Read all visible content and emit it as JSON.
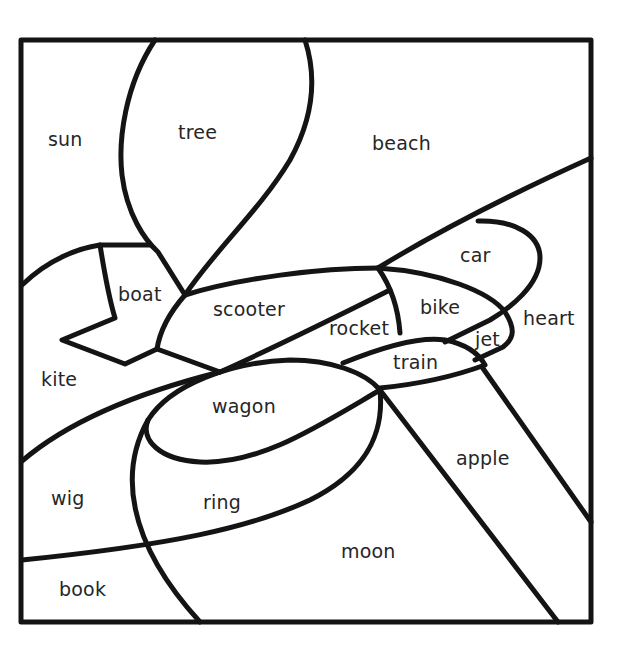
{
  "worksheet": {
    "regions": [
      {
        "id": "sun",
        "label": "sun",
        "x": 48,
        "y": 130
      },
      {
        "id": "tree",
        "label": "tree",
        "x": 178,
        "y": 123
      },
      {
        "id": "beach",
        "label": "beach",
        "x": 372,
        "y": 134
      },
      {
        "id": "car",
        "label": "car",
        "x": 460,
        "y": 246
      },
      {
        "id": "boat",
        "label": "boat",
        "x": 118,
        "y": 285
      },
      {
        "id": "scooter",
        "label": "scooter",
        "x": 213,
        "y": 300
      },
      {
        "id": "bike",
        "label": "bike",
        "x": 420,
        "y": 298
      },
      {
        "id": "heart",
        "label": "heart",
        "x": 523,
        "y": 309
      },
      {
        "id": "rocket",
        "label": "rocket",
        "x": 329,
        "y": 319
      },
      {
        "id": "jet",
        "label": "jet",
        "x": 475,
        "y": 330
      },
      {
        "id": "train",
        "label": "train",
        "x": 393,
        "y": 353
      },
      {
        "id": "kite",
        "label": "kite",
        "x": 41,
        "y": 370
      },
      {
        "id": "wagon",
        "label": "wagon",
        "x": 212,
        "y": 397
      },
      {
        "id": "apple",
        "label": "apple",
        "x": 456,
        "y": 449
      },
      {
        "id": "wig",
        "label": "wig",
        "x": 51,
        "y": 489
      },
      {
        "id": "ring",
        "label": "ring",
        "x": 203,
        "y": 493
      },
      {
        "id": "moon",
        "label": "moon",
        "x": 341,
        "y": 542
      },
      {
        "id": "book",
        "label": "book",
        "x": 59,
        "y": 580
      }
    ],
    "line_color": "#141414",
    "text_color": "#262626",
    "background": "#ffffff"
  }
}
